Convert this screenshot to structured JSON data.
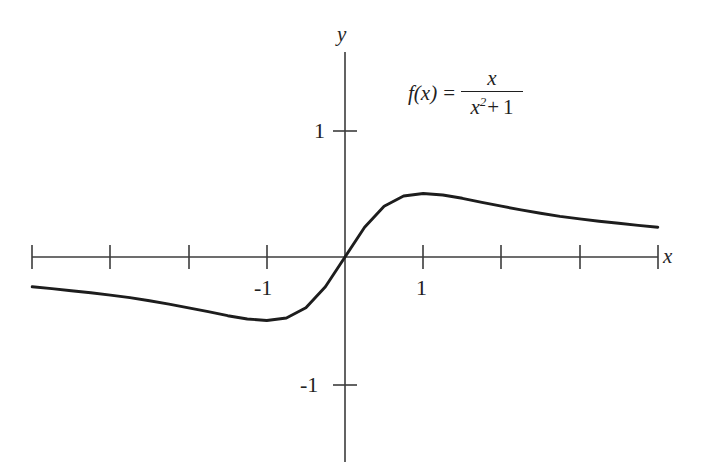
{
  "figure": {
    "formula": {
      "function_name": "f(x)",
      "equals": "=",
      "numerator": "x",
      "denominator_base": "x",
      "denominator_exponent": "2",
      "denominator_plus": "+",
      "denominator_one": "1",
      "plain_text": "f(x) = x / (x^2 + 1)"
    },
    "axis_labels": {
      "x": "x",
      "y": "y"
    },
    "tick_labels": {
      "x_neg_one": "-1",
      "x_pos_one": "1",
      "y_pos_one": "1",
      "y_neg_one": "-1"
    },
    "colors": {
      "axis": "#3c3c3c",
      "curve": "#1d1d1d",
      "background": "#ffffff",
      "text": "#222222"
    }
  },
  "chart_data": {
    "type": "line",
    "title": "",
    "subtitle": "",
    "xlabel": "x",
    "ylabel": "y",
    "annotations": [
      "f(x) = x/(x^2 + 1)"
    ],
    "legend": [],
    "legend_position": "none",
    "grid": false,
    "xlim": [
      -4.05,
      4.05
    ],
    "ylim": [
      -1.6,
      1.6
    ],
    "xticks": [
      -4,
      -3,
      -2,
      -1,
      0,
      1,
      2,
      3,
      4
    ],
    "xtick_labels": [
      "",
      "",
      "",
      "-1",
      "",
      "1",
      "",
      "",
      ""
    ],
    "yticks": [
      -1,
      1
    ],
    "ytick_labels": [
      "-1",
      "1"
    ],
    "series": [
      {
        "name": "f(x) = x/(x^2+1)",
        "x": [
          -4.0,
          -3.75,
          -3.5,
          -3.25,
          -3.0,
          -2.75,
          -2.5,
          -2.25,
          -2.0,
          -1.75,
          -1.5,
          -1.25,
          -1.0,
          -0.75,
          -0.5,
          -0.25,
          0.0,
          0.25,
          0.5,
          0.75,
          1.0,
          1.25,
          1.5,
          1.75,
          2.0,
          2.25,
          2.5,
          2.75,
          3.0,
          3.25,
          3.5,
          3.75,
          4.0
        ],
        "y": [
          -0.235,
          -0.249,
          -0.265,
          -0.282,
          -0.3,
          -0.32,
          -0.345,
          -0.371,
          -0.4,
          -0.431,
          -0.462,
          -0.488,
          -0.5,
          -0.48,
          -0.4,
          -0.235,
          0.0,
          0.235,
          0.4,
          0.48,
          0.5,
          0.488,
          0.462,
          0.431,
          0.4,
          0.371,
          0.345,
          0.32,
          0.3,
          0.282,
          0.265,
          0.249,
          0.235
        ]
      }
    ],
    "key_points": {
      "maximum": {
        "x": 1,
        "y": 0.5
      },
      "minimum": {
        "x": -1,
        "y": -0.5
      },
      "root": {
        "x": 0,
        "y": 0
      }
    }
  }
}
